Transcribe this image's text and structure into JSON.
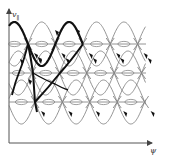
{
  "figure": {
    "type": "phase-space diagram",
    "axes": {
      "y_label": "v",
      "y_label_sub": "∥",
      "x_label": "ψ"
    },
    "colors": {
      "axis": "#555555",
      "separatrix": "#888888",
      "thin_orbit": "#777777",
      "thick_orbit": "#111111",
      "arrow": "#111111"
    },
    "separatrix_rows": [
      {
        "y": 44,
        "xpoint_offset": 28
      },
      {
        "y": 73,
        "xpoint_offset": 32
      },
      {
        "y": 102,
        "xpoint_offset": 35
      }
    ],
    "period_px": 27.4,
    "islands_per_row": 5
  }
}
